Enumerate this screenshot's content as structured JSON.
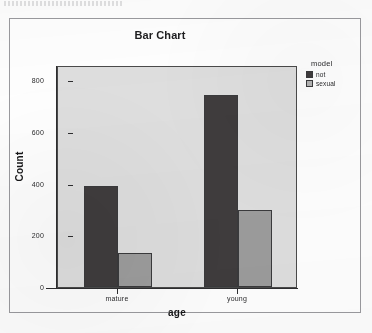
{
  "figure": {
    "title": "Bar Chart"
  },
  "legend": {
    "title": "model",
    "entries": [
      {
        "label": "not",
        "color": "#3f3c3d"
      },
      {
        "label": "sexual",
        "color": "#9c9c9c"
      }
    ]
  },
  "axes": {
    "y_title": "Count",
    "x_title": "age",
    "y_ticks": [
      "0",
      "200",
      "400",
      "600",
      "800"
    ],
    "x_ticks": [
      "mature",
      "young"
    ]
  },
  "chart_data": {
    "type": "bar",
    "title": "Bar Chart",
    "xlabel": "age",
    "ylabel": "Count",
    "categories": [
      "mature",
      "young"
    ],
    "series": [
      {
        "name": "not",
        "values": [
          390,
          745
        ],
        "color": "#3f3c3d"
      },
      {
        "name": "sexual",
        "values": [
          130,
          300
        ],
        "color": "#9c9c9c"
      }
    ],
    "legend_title": "model",
    "legend_position": "right",
    "ylim": [
      0,
      860
    ],
    "yticks": [
      0,
      200,
      400,
      600,
      800
    ],
    "grid": false,
    "bar_mode": "grouped",
    "plot_background": "#dedede"
  }
}
